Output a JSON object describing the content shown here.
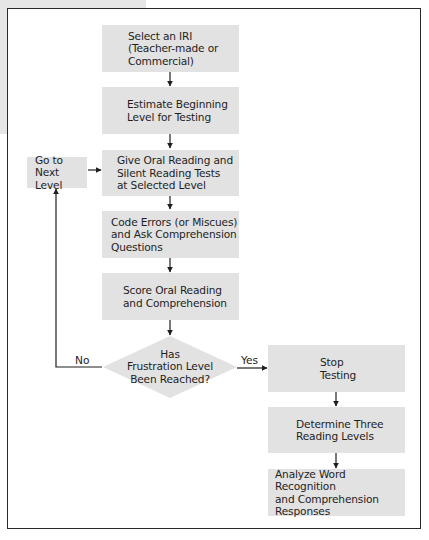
{
  "diagram": {
    "type": "flowchart",
    "colors": {
      "box_fill": "#e2e2e2",
      "line": "#1e1e1e",
      "frame": "#2a2a2a",
      "outer_background": "#e6e6e6"
    },
    "nodes": {
      "select_iri": "Select an IRI\n(Teacher-made or\nCommercial)",
      "estimate_level": "Estimate Beginning\nLevel for Testing",
      "give_tests": "Give Oral Reading and\nSilent Reading Tests\nat Selected Level",
      "code_errors": "Code Errors (or Miscues)\nand Ask Comprehension\nQuestions",
      "score": "Score Oral Reading\nand Comprehension",
      "decision": "Has\nFrustration Level\nBeen Reached?",
      "next_level": "Go to\nNext Level",
      "stop_testing": "Stop\nTesting",
      "determine_levels": "Determine Three\nReading Levels",
      "analyze": "Analyze Word Recognition\nand Comprehension\nResponses"
    },
    "edge_labels": {
      "no": "No",
      "yes": "Yes"
    },
    "edges": [
      {
        "from": "select_iri",
        "to": "estimate_level"
      },
      {
        "from": "estimate_level",
        "to": "give_tests"
      },
      {
        "from": "give_tests",
        "to": "code_errors"
      },
      {
        "from": "code_errors",
        "to": "score"
      },
      {
        "from": "score",
        "to": "decision"
      },
      {
        "from": "decision",
        "to": "next_level",
        "label": "No"
      },
      {
        "from": "next_level",
        "to": "give_tests"
      },
      {
        "from": "decision",
        "to": "stop_testing",
        "label": "Yes"
      },
      {
        "from": "stop_testing",
        "to": "determine_levels"
      },
      {
        "from": "determine_levels",
        "to": "analyze"
      }
    ]
  }
}
